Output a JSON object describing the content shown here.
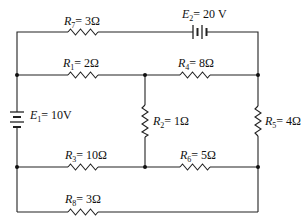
{
  "diagram": {
    "type": "electrical circuit schematic",
    "resistors": [
      {
        "id": "R7",
        "name": "R",
        "sub": "7",
        "value": "= 3Ω"
      },
      {
        "id": "R1",
        "name": "R",
        "sub": "1",
        "value": "= 2Ω"
      },
      {
        "id": "R4",
        "name": "R",
        "sub": "4",
        "value": "= 8Ω"
      },
      {
        "id": "R2",
        "name": "R",
        "sub": "2",
        "value": "= 1Ω"
      },
      {
        "id": "R5",
        "name": "R",
        "sub": "5",
        "value": "= 4Ω"
      },
      {
        "id": "R3",
        "name": "R",
        "sub": "3",
        "value": "= 10Ω"
      },
      {
        "id": "R6",
        "name": "R",
        "sub": "6",
        "value": "= 5Ω"
      },
      {
        "id": "R8",
        "name": "R",
        "sub": "8",
        "value": "= 3Ω"
      }
    ],
    "sources": [
      {
        "id": "E2",
        "name": "E",
        "sub": "2",
        "value": "= 20 V"
      },
      {
        "id": "E1",
        "name": "E",
        "sub": "1",
        "value": "= 10V"
      }
    ]
  }
}
